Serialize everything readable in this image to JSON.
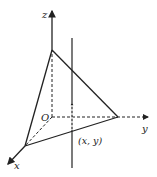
{
  "diagram": {
    "title": "",
    "axes": {
      "x_label": "x",
      "y_label": "y",
      "z_label": "z",
      "origin_label": "O"
    },
    "point_label": "(x, y)",
    "colors": {
      "stroke": "#222222",
      "background": "#ffffff"
    }
  }
}
